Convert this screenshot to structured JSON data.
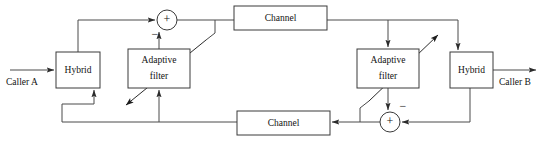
{
  "figure": {
    "type": "block-diagram",
    "canvas": {
      "width": 545,
      "height": 144
    },
    "colors": {
      "background": "#ffffff",
      "box_stroke": "#3a3a3a",
      "wire": "#4a4a4a",
      "text": "#111111"
    }
  },
  "blocks": {
    "hybrid_left": {
      "label": "Hybrid",
      "x": 56,
      "y": 52,
      "w": 44,
      "h": 36
    },
    "hybrid_right": {
      "label": "Hybrid",
      "x": 450,
      "y": 52,
      "w": 43,
      "h": 36
    },
    "adaptive_left": {
      "label_line1": "Adaptive",
      "label_line2": "filter",
      "x": 128,
      "y": 49,
      "w": 62,
      "h": 39
    },
    "adaptive_right": {
      "label_line1": "Adaptive",
      "label_line2": "filter",
      "x": 357,
      "y": 49,
      "w": 62,
      "h": 39
    },
    "channel_top": {
      "label": "Channel",
      "x": 234,
      "y": 6,
      "w": 93,
      "h": 24
    },
    "channel_bottom": {
      "label": "Channel",
      "x": 237,
      "y": 111,
      "w": 93,
      "h": 24
    }
  },
  "summers": {
    "top": {
      "plus": "+",
      "minus": "−",
      "cx": 167,
      "cy": 20,
      "r": 10
    },
    "bottom": {
      "plus": "+",
      "minus": "−",
      "cx": 390,
      "cy": 122,
      "r": 10
    }
  },
  "terminals": {
    "caller_a": {
      "label": "Caller A",
      "x": 6,
      "y": 84
    },
    "caller_b": {
      "label": "Caller B",
      "x": 499,
      "y": 84
    }
  },
  "signal_paths": [
    {
      "name": "caller-a-input-to-hybrid-left",
      "from": "Caller A",
      "to": "Hybrid (left)"
    },
    {
      "name": "hybrid-left-to-top-summer",
      "from": "Hybrid (left)",
      "to": "top summer (+)"
    },
    {
      "name": "adaptive-left-to-top-summer",
      "from": "Adaptive filter (left)",
      "to": "top summer (−)"
    },
    {
      "name": "top-summer-to-channel-top",
      "from": "top summer",
      "to": "Channel (top)"
    },
    {
      "name": "top-summer-output-tap-to-adaptive-left",
      "from": "top summer output",
      "to": "Adaptive filter (left) error input"
    },
    {
      "name": "channel-top-to-right-branch",
      "from": "Channel (top)",
      "to": "Adaptive filter (right) & Hybrid (right)"
    },
    {
      "name": "hybrid-right-to-caller-b",
      "from": "Hybrid (right)",
      "to": "Caller B"
    },
    {
      "name": "adaptive-right-to-bottom-summer",
      "from": "Adaptive filter (right)",
      "to": "bottom summer (−)"
    },
    {
      "name": "hybrid-right-to-bottom-summer",
      "from": "Hybrid (right)",
      "to": "bottom summer (+)"
    },
    {
      "name": "bottom-summer-to-channel-bottom",
      "from": "bottom summer",
      "to": "Channel (bottom)"
    },
    {
      "name": "bottom-summer-output-tap-to-adaptive-right",
      "from": "bottom summer output",
      "to": "Adaptive filter (right) error input"
    },
    {
      "name": "channel-bottom-to-left-bus",
      "from": "Channel (bottom)",
      "to": "Hybrid (left) & Adaptive filter (left)"
    }
  ]
}
